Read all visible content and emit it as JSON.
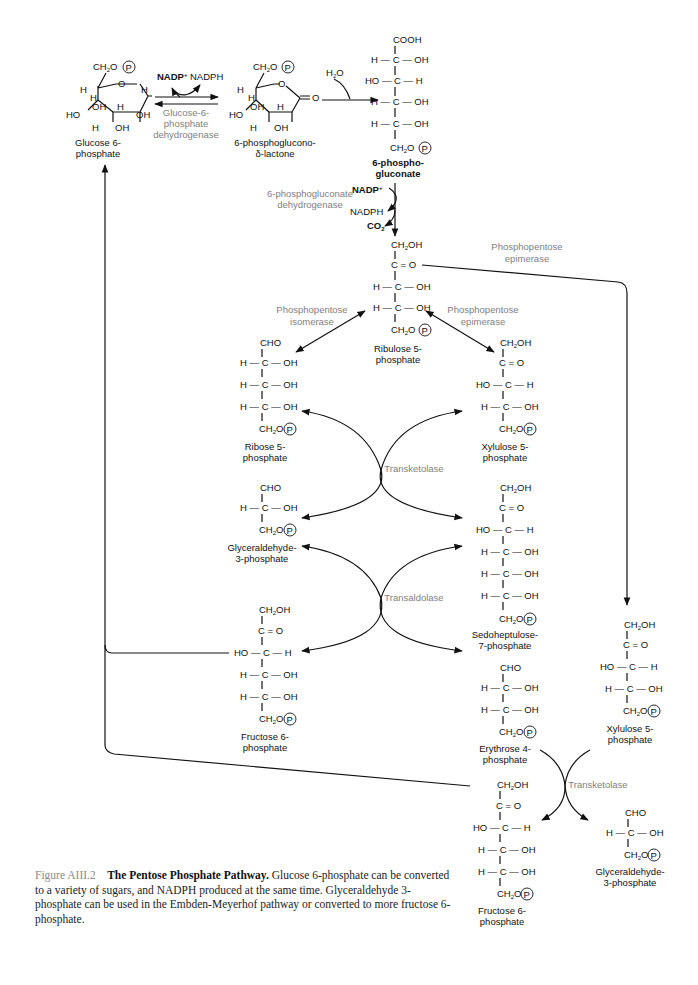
{
  "figure": {
    "number": "Figure AIII.2",
    "title": "The Pentose Phosphate Pathway.",
    "caption": "Glucose 6-phosphate can be converted to a variety of sugars, and NADPH produced at the same time. Glyceraldehyde 3-phosphate can be used in the Embden-Meyerhof pathway or converted to more fructose 6-phosphate."
  },
  "compounds": {
    "glucose6p": {
      "line1": "Glucose 6-",
      "line2": "phosphate"
    },
    "lactone": {
      "line1": "6-phosphoglucono-",
      "line2": "δ-lactone"
    },
    "gluconate6p": {
      "line1": "6-phospho-",
      "line2": "gluconate"
    },
    "ribulose5p": {
      "line1": "Ribulose 5-",
      "line2": "phosphate"
    },
    "ribose5p": {
      "line1": "Ribose 5-",
      "line2": "phosphate"
    },
    "xylulose5p_a": {
      "line1": "Xylulose 5-",
      "line2": "phosphate"
    },
    "g3p_a": {
      "line1": "Glyceraldehyde-",
      "line2": "3-phosphate"
    },
    "sedoheptulose7p": {
      "line1": "Sedoheptulose-",
      "line2": "7-phosphate"
    },
    "fructose6p_a": {
      "line1": "Fructose 6-",
      "line2": "phosphate"
    },
    "erythrose4p": {
      "line1": "Erythrose 4-",
      "line2": "phosphate"
    },
    "xylulose5p_b": {
      "line1": "Xylulose 5-",
      "line2": "phosphate"
    },
    "fructose6p_b": {
      "line1": "Fructose 6-",
      "line2": "phosphate"
    },
    "g3p_b": {
      "line1": "Glyceraldehyde-",
      "line2": "3-phosphate"
    }
  },
  "enzymes": {
    "g6pdh": [
      "Glucose-6-",
      "phosphate",
      "dehydrogenase"
    ],
    "pgdh": [
      "6-phosphogluconate",
      "dehydrogenase"
    ],
    "isomerase": [
      "Phosphopentose",
      "isomerase"
    ],
    "epimerase_a": [
      "Phosphopentose",
      "epimerase"
    ],
    "epimerase_b": [
      "Phosphopentose",
      "epimerase"
    ],
    "transketolase_a": "Transketolase",
    "transaldolase": "Transaldolase",
    "transketolase_b": "Transketolase"
  },
  "cofactors": {
    "nadp": "NADP",
    "nadph": "NADPH",
    "h2o": "H",
    "co2": "CO"
  },
  "groups": {
    "ch2op": "CH",
    "p": "P",
    "ch2oh": "CH",
    "cooh": "COOH",
    "cho": "CHO",
    "keto": "C = O",
    "hcoh": "H — C — OH",
    "hoch": "HO — C — H",
    "hcoh_short": "H — C — OH",
    "hoch_short": "HO — C — H",
    "h": "H",
    "oh": "OH",
    "ho": "HO",
    "o": "O",
    "eqo": "= O"
  }
}
